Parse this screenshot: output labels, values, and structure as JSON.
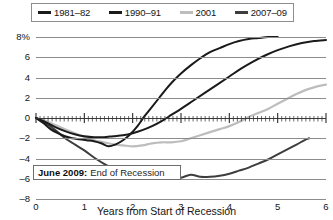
{
  "chart_data": {
    "type": "line",
    "title": "",
    "xlabel": "Years from Start of Recession",
    "ylabel": "",
    "xlim": [
      0,
      6
    ],
    "ylim": [
      -8,
      8
    ],
    "grid": true,
    "legend_position": "top",
    "x_ticks": [
      "0",
      "1",
      "2",
      "3",
      "4",
      "5",
      "6"
    ],
    "y_ticks": [
      "8%",
      "6",
      "4",
      "2",
      "0",
      "-2",
      "-4",
      "-6",
      "-8"
    ],
    "annotations": [
      {
        "bold": "June 2009:",
        "text": "End of Recession"
      }
    ],
    "series": [
      {
        "name": "1981–82",
        "color": "#1a1a1a",
        "points": [
          [
            0.0,
            0.0
          ],
          [
            0.15,
            -0.5
          ],
          [
            0.3,
            -1.1
          ],
          [
            0.45,
            -1.5
          ],
          [
            0.6,
            -1.8
          ],
          [
            0.75,
            -2.0
          ],
          [
            0.9,
            -2.1
          ],
          [
            1.05,
            -2.2
          ],
          [
            1.2,
            -2.3
          ],
          [
            1.35,
            -2.5
          ],
          [
            1.5,
            -2.8
          ],
          [
            1.65,
            -2.6
          ],
          [
            1.8,
            -2.2
          ],
          [
            1.95,
            -1.6
          ],
          [
            2.1,
            -0.8
          ],
          [
            2.25,
            0.2
          ],
          [
            2.4,
            1.1
          ],
          [
            2.55,
            2.0
          ],
          [
            2.7,
            2.9
          ],
          [
            2.85,
            3.7
          ],
          [
            3.0,
            4.4
          ],
          [
            3.2,
            5.2
          ],
          [
            3.4,
            5.9
          ],
          [
            3.6,
            6.5
          ],
          [
            3.8,
            6.9
          ],
          [
            4.0,
            7.3
          ],
          [
            4.2,
            7.6
          ],
          [
            4.4,
            7.8
          ],
          [
            4.6,
            7.9
          ],
          [
            4.8,
            8.0
          ],
          [
            5.0,
            8.0
          ]
        ]
      },
      {
        "name": "1990–91",
        "color": "#1a1a1a",
        "points": [
          [
            0.0,
            0.0
          ],
          [
            0.2,
            -0.4
          ],
          [
            0.4,
            -0.9
          ],
          [
            0.6,
            -1.3
          ],
          [
            0.8,
            -1.6
          ],
          [
            1.0,
            -1.8
          ],
          [
            1.2,
            -1.9
          ],
          [
            1.4,
            -1.9
          ],
          [
            1.6,
            -1.8
          ],
          [
            1.8,
            -1.7
          ],
          [
            2.0,
            -1.5
          ],
          [
            2.2,
            -1.2
          ],
          [
            2.4,
            -0.8
          ],
          [
            2.6,
            -0.3
          ],
          [
            2.8,
            0.3
          ],
          [
            3.0,
            0.9
          ],
          [
            3.25,
            1.7
          ],
          [
            3.5,
            2.5
          ],
          [
            3.75,
            3.3
          ],
          [
            4.0,
            4.1
          ],
          [
            4.25,
            4.9
          ],
          [
            4.5,
            5.6
          ],
          [
            4.75,
            6.2
          ],
          [
            5.0,
            6.7
          ],
          [
            5.25,
            7.1
          ],
          [
            5.5,
            7.4
          ],
          [
            5.75,
            7.6
          ],
          [
            6.0,
            7.7
          ]
        ]
      },
      {
        "name": "2001",
        "color": "#bdbdbd",
        "points": [
          [
            0.0,
            0.0
          ],
          [
            0.2,
            -0.3
          ],
          [
            0.4,
            -0.7
          ],
          [
            0.6,
            -1.1
          ],
          [
            0.8,
            -1.5
          ],
          [
            1.0,
            -1.9
          ],
          [
            1.2,
            -2.2
          ],
          [
            1.4,
            -2.4
          ],
          [
            1.6,
            -2.6
          ],
          [
            1.8,
            -2.7
          ],
          [
            2.0,
            -2.8
          ],
          [
            2.2,
            -2.7
          ],
          [
            2.4,
            -2.5
          ],
          [
            2.6,
            -2.4
          ],
          [
            2.8,
            -2.4
          ],
          [
            3.0,
            -2.3
          ],
          [
            3.2,
            -2.0
          ],
          [
            3.4,
            -1.7
          ],
          [
            3.6,
            -1.4
          ],
          [
            3.8,
            -1.1
          ],
          [
            4.0,
            -0.8
          ],
          [
            4.2,
            -0.4
          ],
          [
            4.4,
            0.1
          ],
          [
            4.6,
            0.5
          ],
          [
            4.8,
            0.9
          ],
          [
            5.0,
            1.4
          ],
          [
            5.2,
            1.9
          ],
          [
            5.4,
            2.4
          ],
          [
            5.6,
            2.8
          ],
          [
            5.8,
            3.1
          ],
          [
            6.0,
            3.3
          ]
        ]
      },
      {
        "name": "2007–09",
        "color": "#3d3d3d",
        "points": [
          [
            0.0,
            0.0
          ],
          [
            0.2,
            -0.5
          ],
          [
            0.4,
            -1.2
          ],
          [
            0.6,
            -2.0
          ],
          [
            0.8,
            -2.6
          ],
          [
            1.0,
            -3.2
          ],
          [
            1.2,
            -3.9
          ],
          [
            1.4,
            -4.5
          ],
          [
            1.6,
            -5.0
          ],
          [
            1.8,
            -5.4
          ],
          [
            2.0,
            -5.7
          ],
          [
            2.2,
            -5.9
          ],
          [
            2.4,
            -6.0
          ],
          [
            2.6,
            -6.0
          ],
          [
            2.8,
            -5.9
          ],
          [
            3.0,
            -5.9
          ],
          [
            3.2,
            -5.6
          ],
          [
            3.4,
            -5.8
          ],
          [
            3.6,
            -5.8
          ],
          [
            3.8,
            -5.7
          ],
          [
            4.0,
            -5.5
          ],
          [
            4.2,
            -5.2
          ],
          [
            4.4,
            -4.9
          ],
          [
            4.6,
            -4.5
          ],
          [
            4.8,
            -4.1
          ],
          [
            5.0,
            -3.6
          ],
          [
            5.2,
            -3.1
          ],
          [
            5.4,
            -2.6
          ],
          [
            5.55,
            -2.2
          ],
          [
            5.65,
            -2.0
          ]
        ]
      }
    ]
  },
  "legend": {
    "items": [
      {
        "label": "1981–82",
        "color": "#1a1a1a"
      },
      {
        "label": "1990–91",
        "color": "#1a1a1a"
      },
      {
        "label": "2001",
        "color": "#bdbdbd"
      },
      {
        "label": "2007–09",
        "color": "#3d3d3d"
      }
    ]
  },
  "axis": {
    "x_title": "Years from Start of Recession",
    "x_labels": [
      "0",
      "1",
      "2",
      "3",
      "4",
      "5",
      "6"
    ],
    "y_labels": [
      "8%",
      "6",
      "4",
      "2",
      "0",
      "–2",
      "–4",
      "–6",
      "–8"
    ]
  },
  "annotation": {
    "bold": "June 2009:",
    "text": "End of Recession"
  }
}
